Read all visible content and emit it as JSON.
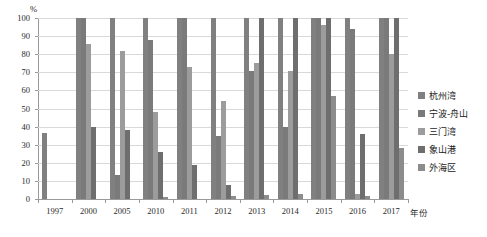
{
  "chart_data": {
    "type": "bar",
    "title": "",
    "xlabel": "年份",
    "ylabel": "%",
    "ylim": [
      0,
      100
    ],
    "ytick_labels": [
      "0",
      "10",
      "20",
      "30",
      "40",
      "50",
      "60",
      "70",
      "80",
      "90",
      "100"
    ],
    "grid": true,
    "legend_position": "right",
    "categories": [
      "1997",
      "2000",
      "2005",
      "2010",
      "2011",
      "2012",
      "2013",
      "2014",
      "2015",
      "2016",
      "2017"
    ],
    "series": [
      {
        "name": "杭州湾",
        "color": "#808080",
        "values": [
          36.5,
          100,
          100,
          100,
          100,
          100,
          100,
          100,
          100,
          100,
          100
        ]
      },
      {
        "name": "宁波-舟山",
        "color": "#7a7a7a",
        "values": [
          0,
          100,
          13,
          88,
          100,
          35,
          71,
          40,
          100,
          94,
          100
        ]
      },
      {
        "name": "三门湾",
        "color": "#9c9c9c",
        "values": [
          0,
          85.5,
          82,
          48,
          73,
          54,
          75,
          71,
          96,
          3,
          80
        ]
      },
      {
        "name": "象山港",
        "color": "#6e6e6e",
        "values": [
          0,
          40,
          38,
          26,
          19,
          8,
          100,
          100,
          100,
          36,
          100
        ]
      },
      {
        "name": "外海区",
        "color": "#8c8c8c",
        "values": [
          0,
          0,
          0,
          1,
          0,
          1.5,
          2,
          2.5,
          57,
          1.5,
          28
        ]
      }
    ]
  },
  "axis": {
    "y_unit": "%",
    "x_title": "年份"
  },
  "legend": {
    "items": [
      {
        "label": "杭州湾",
        "color": "#808080"
      },
      {
        "label": "宁波-舟山",
        "color": "#7a7a7a"
      },
      {
        "label": "三门湾",
        "color": "#9c9c9c"
      },
      {
        "label": "象山港",
        "color": "#6e6e6e"
      },
      {
        "label": "外海区",
        "color": "#8c8c8c"
      }
    ]
  }
}
